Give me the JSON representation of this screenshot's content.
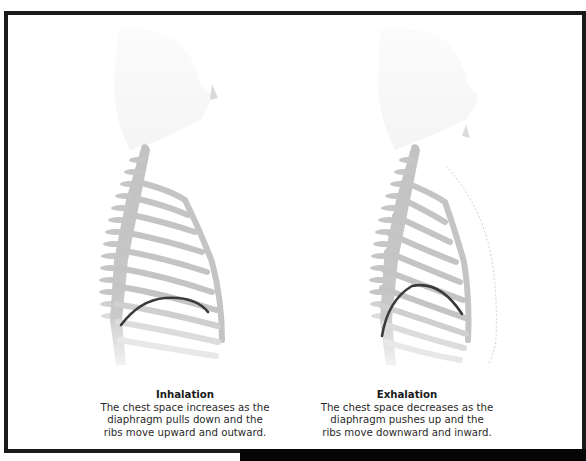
{
  "figure": {
    "panels": [
      {
        "id": "inhalation",
        "title": "Inhalation",
        "lines": [
          "The chest space increases as the",
          "diaphragm pulls down and the",
          "ribs move upward and outward."
        ]
      },
      {
        "id": "exhalation",
        "title": "Exhalation",
        "lines": [
          "The chest space decreases as the",
          "diaphragm pushes up and the",
          "ribs move downward and inward."
        ]
      }
    ],
    "colors": {
      "frame": "#1a1a1a",
      "ribs": "#c4c4c4",
      "diaphragm": "#3a3a3a",
      "body_outline": "#d8d8d8"
    }
  }
}
